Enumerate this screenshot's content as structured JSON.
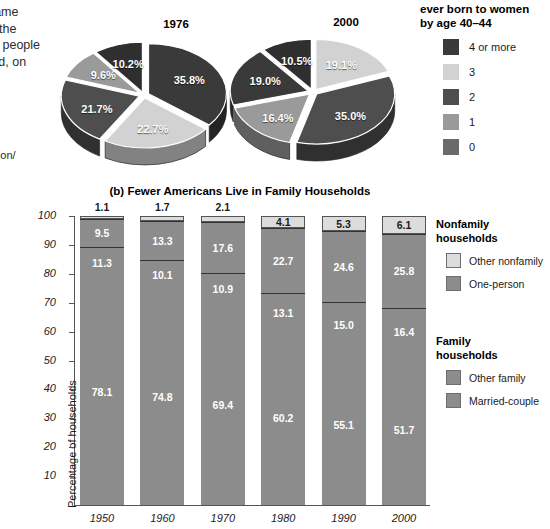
{
  "left_text": {
    "lines": [
      "became",
      "rt of the",
      "nore people",
      "n had, on",
      "n."
    ],
    "source_lines": [
      "od/",
      "oulation/",
      "df )"
    ]
  },
  "pie_section": {
    "legend_title_line1": "ever born to women",
    "legend_title_line2": "by age 40–44",
    "legend": [
      {
        "label": "4 or more",
        "color": "#3a3a3a"
      },
      {
        "label": "3",
        "color": "#d2d2d2"
      },
      {
        "label": "2",
        "color": "#4e4e4e"
      },
      {
        "label": "1",
        "color": "#9a9a9a"
      },
      {
        "label": "0",
        "color": "#6a6a6a"
      }
    ],
    "charts": [
      {
        "title": "1976",
        "slices": [
          {
            "category": "4 or more",
            "value": 35.8,
            "label": "35.8%",
            "color": "#3a3a3a"
          },
          {
            "category": "3",
            "value": 22.7,
            "label": "22.7%",
            "color": "#d2d2d2"
          },
          {
            "category": "2",
            "value": 21.7,
            "label": "21.7%",
            "color": "#4e4e4e"
          },
          {
            "category": "1",
            "value": 9.6,
            "label": "9.6%",
            "color": "#9a9a9a"
          },
          {
            "category": "0",
            "value": 10.2,
            "label": "10.2%",
            "color": "#2f2f2f"
          }
        ]
      },
      {
        "title": "2000",
        "slices": [
          {
            "category": "3",
            "value": 19.1,
            "label": "19.1%",
            "color": "#d2d2d2"
          },
          {
            "category": "4 or more",
            "value": 35.0,
            "label": "35.0%",
            "color": "#4e4e4e"
          },
          {
            "category": "2",
            "value": 16.4,
            "label": "16.4%",
            "color": "#9a9a9a"
          },
          {
            "category": "1",
            "value": 19.0,
            "label": "19.0%",
            "color": "#3a3a3a"
          },
          {
            "category": "0",
            "value": 10.5,
            "label": "10.5%",
            "color": "#2f2f2f"
          }
        ]
      }
    ]
  },
  "chart_data": {
    "type": "bar",
    "title": "(b) Fewer Americans Live in Family Households",
    "xlabel": "",
    "ylabel": "Percentage of households",
    "ylim": [
      0,
      100
    ],
    "yticks": [
      100,
      90,
      80,
      70,
      60,
      50,
      40,
      30,
      20,
      10
    ],
    "grid": false,
    "stacked": true,
    "legend_position": "right",
    "categories": [
      "1950",
      "1960",
      "1970",
      "1980",
      "1990",
      "2000"
    ],
    "series": [
      {
        "name": "Married-couple",
        "color": "#8c8c8c",
        "values": [
          78.1,
          74.8,
          69.4,
          60.2,
          55.1,
          51.7
        ]
      },
      {
        "name": "Other family",
        "color": "#8c8c8c",
        "values": [
          11.3,
          10.1,
          10.9,
          13.1,
          15.0,
          16.4
        ]
      },
      {
        "name": "One-person",
        "color": "#8c8c8c",
        "values": [
          9.5,
          13.3,
          17.6,
          22.7,
          24.6,
          25.8
        ]
      },
      {
        "name": "Other nonfamily",
        "color": "#dcdcdc",
        "values": [
          1.1,
          1.7,
          2.1,
          4.1,
          5.3,
          6.1
        ]
      }
    ],
    "legend_groups": [
      {
        "title_line1": "Nonfamily",
        "title_line2": "households",
        "entries": [
          {
            "label": "Other nonfamily",
            "color": "#dcdcdc"
          },
          {
            "label": "One-person",
            "color": "#8c8c8c"
          }
        ]
      },
      {
        "title_line1": "Family",
        "title_line2": "households",
        "entries": [
          {
            "label": "Other family",
            "color": "#8c8c8c"
          },
          {
            "label": "Married-couple",
            "color": "#8c8c8c"
          }
        ]
      }
    ]
  }
}
